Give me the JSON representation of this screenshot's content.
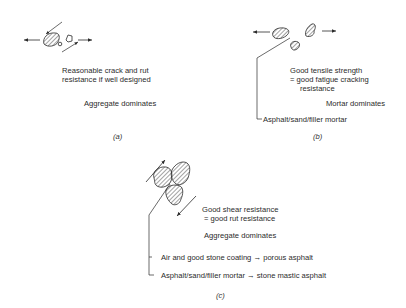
{
  "panels": {
    "a": {
      "caption": "(a)",
      "lines": [
        "Reasonable crack and rut",
        "resistance if well designed"
      ],
      "dominates": "Aggregate dominates"
    },
    "b": {
      "caption": "(b)",
      "lines": [
        "Good tensile strength",
        "= good fatigue cracking",
        "resistance"
      ],
      "dominates": "Mortar dominates",
      "pointer_label": "Asphalt/sand/filler mortar"
    },
    "c": {
      "caption": "(c)",
      "lines": [
        "Good shear resistance",
        "= good rut resistance"
      ],
      "dominates": "Aggregate dominates",
      "pointer_labels": [
        "Air and good stone coating → porous asphalt",
        "Asphalt/sand/filler mortar → stone mastic asphalt"
      ]
    }
  },
  "style": {
    "ink": "#2b2b2b",
    "background": "#ffffff"
  }
}
